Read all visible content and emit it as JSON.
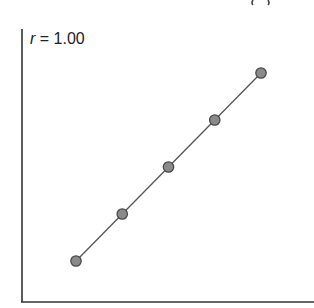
{
  "chart_data": {
    "type": "scatter",
    "title": "",
    "annotation": {
      "var": "r",
      "text": " = 1.00"
    },
    "xlabel": "",
    "ylabel": "",
    "x": [
      1,
      2,
      3,
      4,
      5
    ],
    "y": [
      1,
      2,
      3,
      4,
      5
    ],
    "series": [
      {
        "name": "points",
        "x": [
          1,
          2,
          3,
          4,
          5
        ],
        "y": [
          1,
          2,
          3,
          4,
          5
        ]
      }
    ],
    "fit_line": true,
    "xlim": [
      0,
      6.1
    ],
    "ylim": [
      0,
      6.1
    ],
    "grid": false,
    "ticks": false,
    "colors": {
      "marker_fill": "#8a8a8a",
      "marker_edge": "#4a4a4a",
      "line": "#555555",
      "axis": "#333333"
    }
  }
}
